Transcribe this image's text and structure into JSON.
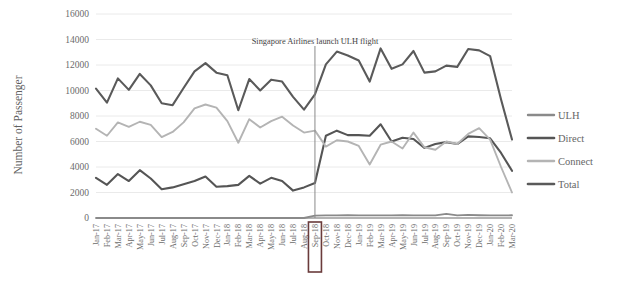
{
  "chart_data": {
    "type": "line",
    "title": "",
    "xlabel": "",
    "ylabel": "Number of Passenger",
    "ylim": [
      0,
      16000
    ],
    "yticks": [
      0,
      2000,
      4000,
      6000,
      8000,
      10000,
      12000,
      14000,
      16000
    ],
    "grid": true,
    "legend_position": "right",
    "annotations": [
      {
        "text": "Singapore Airlines launch ULH flight",
        "at_category": "Sep-18",
        "kind": "vertical-line-with-label"
      }
    ],
    "highlighted_category": "Sep-18",
    "categories": [
      "Jan-17",
      "Feb-17",
      "Mar-17",
      "Apr-17",
      "May-17",
      "Jun-17",
      "Jul-17",
      "Aug-17",
      "Sep-17",
      "Oct-17",
      "Nov-17",
      "Dec-17",
      "Jan-18",
      "Feb-18",
      "Mar-18",
      "Apr-18",
      "May-18",
      "Jun-18",
      "Jul-18",
      "Aug-18",
      "Sep-18",
      "Oct-18",
      "Nov-18",
      "Dec-18",
      "Jan-19",
      "Feb-19",
      "Mar-19",
      "Apr-19",
      "May-19",
      "Jun-19",
      "Jul-19",
      "Aug-19",
      "Sep-19",
      "Oct-19",
      "Nov-19",
      "Dec-19",
      "Jan-20",
      "Feb-20",
      "Mar-20"
    ],
    "series": [
      {
        "name": "ULH",
        "color": "#8a8a8a",
        "width": 1.8,
        "values": [
          0,
          0,
          0,
          0,
          0,
          0,
          0,
          0,
          0,
          0,
          0,
          0,
          0,
          0,
          0,
          0,
          0,
          0,
          0,
          0,
          180,
          210,
          200,
          215,
          205,
          200,
          210,
          205,
          215,
          210,
          200,
          205,
          330,
          210,
          240,
          215,
          200,
          205,
          215
        ]
      },
      {
        "name": "Direct",
        "color": "#555555",
        "width": 2.1,
        "values": [
          3150,
          2600,
          3450,
          2900,
          3750,
          3100,
          2250,
          2400,
          2650,
          2900,
          3250,
          2450,
          2500,
          2600,
          3300,
          2700,
          3150,
          2900,
          2150,
          2400,
          2750,
          6450,
          6850,
          6500,
          6500,
          6450,
          7350,
          6000,
          6300,
          6200,
          5500,
          5800,
          5950,
          5800,
          6400,
          6350,
          6250,
          5100,
          3700
        ]
      },
      {
        "name": "Connect",
        "color": "#b4b4b4",
        "width": 1.9,
        "values": [
          7000,
          6450,
          7500,
          7150,
          7550,
          7300,
          6350,
          6750,
          7500,
          8600,
          8900,
          8650,
          7600,
          5900,
          7750,
          7100,
          7600,
          7950,
          7250,
          6700,
          6850,
          5600,
          6100,
          6000,
          5650,
          4200,
          5750,
          6000,
          5450,
          6700,
          5550,
          5350,
          6000,
          5800,
          6600,
          7050,
          6150,
          4000,
          2000
        ]
      },
      {
        "name": "Total",
        "color": "#5a5a5a",
        "width": 2.1,
        "values": [
          10150,
          9050,
          10950,
          10050,
          11300,
          10400,
          9000,
          8850,
          10200,
          11500,
          12150,
          11400,
          11200,
          8450,
          10900,
          10000,
          10850,
          10700,
          9500,
          8500,
          9700,
          12050,
          13050,
          12750,
          12350,
          10700,
          13300,
          11700,
          12050,
          13100,
          11400,
          11500,
          11950,
          11850,
          13250,
          13150,
          12700,
          9300,
          6150
        ]
      }
    ]
  },
  "legend": {
    "items": [
      {
        "label": "ULH"
      },
      {
        "label": "Direct"
      },
      {
        "label": "Connect"
      },
      {
        "label": "Total"
      }
    ]
  }
}
